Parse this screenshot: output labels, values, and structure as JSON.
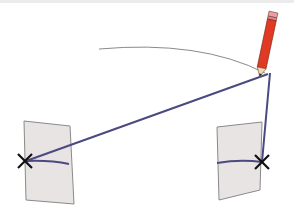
{
  "diagram": {
    "colors": {
      "background": "#ffffff",
      "paper_fill": "#e8e4e4",
      "paper_stroke": "#8a8a8a",
      "line": "#4a4a80",
      "arc": "#8a8a8a",
      "cross": "#111111",
      "pencil_body": "#e03a24",
      "pencil_eraser": "#e8a0a0",
      "pencil_tip": "#f0d8b0"
    },
    "elements": {
      "left_paper": "paper-strip",
      "right_paper": "paper-strip",
      "left_mark": "cross-mark",
      "right_mark": "cross-mark",
      "pencil": "pencil-icon",
      "arc": "arc-curve"
    }
  }
}
